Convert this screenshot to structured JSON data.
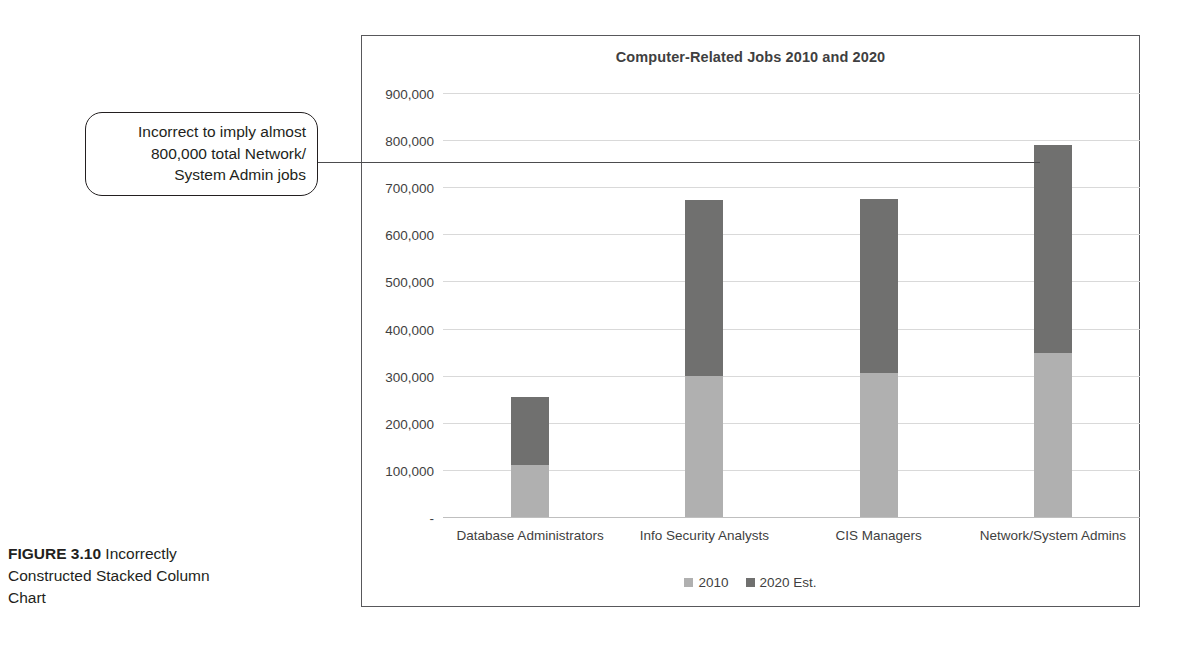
{
  "figure": {
    "label": "FIGURE 3.10",
    "caption": " Incorrectly Constructed Stacked Column Chart"
  },
  "callout": {
    "text": "Incorrect to imply almost 800,000 total Network/System Admin jobs",
    "line1": "Incorrect to imply almost",
    "line2": "800,000 total Network/",
    "line3": "System Admin jobs"
  },
  "colors": {
    "series_2010": "#b0b0b0",
    "series_2020": "#70706f",
    "gridline": "#d9d9d9",
    "frame": "#58585b",
    "text": "#3f3f41"
  },
  "chart_data": {
    "type": "bar",
    "subtype": "stacked-column",
    "title": "Computer-Related Jobs 2010 and 2020",
    "xlabel": "",
    "ylabel": "",
    "ylim": [
      0,
      900000
    ],
    "ytick_values": [
      0,
      100000,
      200000,
      300000,
      400000,
      500000,
      600000,
      700000,
      800000,
      900000
    ],
    "ytick_labels": [
      "-",
      "100,000",
      "200,000",
      "300,000",
      "400,000",
      "500,000",
      "600,000",
      "700,000",
      "800,000",
      "900,000"
    ],
    "grid": true,
    "legend_position": "bottom",
    "categories": [
      "Database Administrators",
      "Info Security Analysts",
      "CIS Managers",
      "Network/System Admins"
    ],
    "series": [
      {
        "name": "2010",
        "color": "#b0b0b0",
        "values": [
          110000,
          300000,
          305000,
          348000
        ]
      },
      {
        "name": "2020 Est.",
        "color": "#70706f",
        "values": [
          145000,
          372000,
          369000,
          442000
        ]
      }
    ],
    "totals": [
      255000,
      672000,
      674000,
      790000
    ]
  }
}
